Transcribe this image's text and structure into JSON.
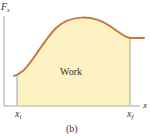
{
  "figure": {
    "y_axis_label": "F",
    "y_axis_subscript": "x",
    "x_axis_label": "x",
    "area_label": "Work",
    "x_start_label": "x",
    "x_start_subscript": "i",
    "x_end_label": "x",
    "x_end_subscript": "f",
    "caption": "(b)"
  },
  "colors": {
    "curve": "#c8783a",
    "fill": "#fdf2c2",
    "axis": "#9a9a9a",
    "text": "#333333"
  }
}
